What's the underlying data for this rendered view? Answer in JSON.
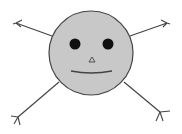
{
  "figure": {
    "colors": {
      "background": "#ffffff",
      "face_fill": "#c8c8c8",
      "stroke": "#444444",
      "eye": "#111111"
    },
    "face": {
      "cx": 91,
      "cy": 53,
      "r": 42
    },
    "eyes": [
      {
        "cx": 75,
        "cy": 44,
        "r": 5.5
      },
      {
        "cx": 108,
        "cy": 44,
        "r": 5.5
      }
    ],
    "nose": {
      "points": "92,57 89,62 95,62"
    },
    "mouth": {
      "path": "M71 71 Q91 75 112 71"
    },
    "limbs": [
      {
        "name": "upper-left",
        "line": [
          52,
          36,
          16,
          23
        ],
        "fork": "M16 23 L22 20 M16 23 L21 27 M16 23 L13 24"
      },
      {
        "name": "upper-right",
        "line": [
          130,
          36,
          167,
          23
        ],
        "fork": "M167 23 L161 20 M167 23 L163 27 M167 23 L170 24"
      },
      {
        "name": "lower-left",
        "line": [
          59,
          82,
          18,
          117
        ],
        "fork": "M18 117 L11 116 M18 117 L14 124 M18 117 L20 125"
      },
      {
        "name": "lower-right",
        "line": [
          124,
          82,
          160,
          112
        ],
        "fork": "M160 112 L170 111 M160 112 L163 121 M160 112 L156 121"
      }
    ]
  }
}
